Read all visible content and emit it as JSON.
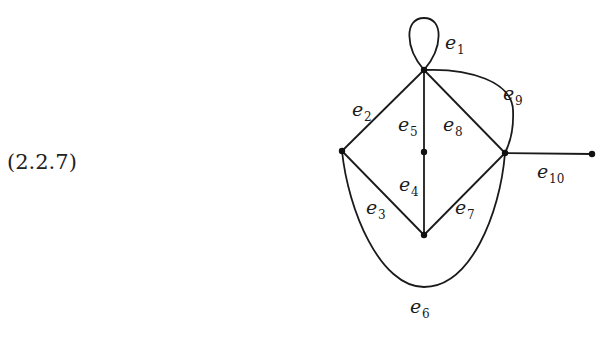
{
  "equation_label": "(2.2.7)",
  "graph": {
    "vertices": [
      {
        "id": "top",
        "x": 424,
        "y": 70
      },
      {
        "id": "left",
        "x": 342,
        "y": 151
      },
      {
        "id": "middle",
        "x": 424,
        "y": 152
      },
      {
        "id": "right",
        "x": 505,
        "y": 153
      },
      {
        "id": "bottom",
        "x": 424,
        "y": 235
      },
      {
        "id": "far-right",
        "x": 592,
        "y": 154
      }
    ],
    "edges": [
      {
        "id": "e1",
        "base": "e",
        "sub": "1",
        "from": "top",
        "to": "top",
        "kind": "loop"
      },
      {
        "id": "e2",
        "base": "e",
        "sub": "2",
        "from": "top",
        "to": "left"
      },
      {
        "id": "e3",
        "base": "e",
        "sub": "3",
        "from": "left",
        "to": "bottom"
      },
      {
        "id": "e4",
        "base": "e",
        "sub": "4",
        "from": "middle",
        "to": "bottom"
      },
      {
        "id": "e5",
        "base": "e",
        "sub": "5",
        "from": "top",
        "to": "middle"
      },
      {
        "id": "e6",
        "base": "e",
        "sub": "6",
        "from": "left",
        "to": "right",
        "kind": "curve-below"
      },
      {
        "id": "e7",
        "base": "e",
        "sub": "7",
        "from": "bottom",
        "to": "right"
      },
      {
        "id": "e8",
        "base": "e",
        "sub": "8",
        "from": "top",
        "to": "right"
      },
      {
        "id": "e9",
        "base": "e",
        "sub": "9",
        "from": "top",
        "to": "right",
        "kind": "curve-outer"
      },
      {
        "id": "e10",
        "base": "e",
        "sub": "10",
        "from": "right",
        "to": "far-right"
      }
    ]
  },
  "labels": {
    "e1": {
      "base": "e",
      "sub": "1"
    },
    "e2": {
      "base": "e",
      "sub": "2"
    },
    "e3": {
      "base": "e",
      "sub": "3"
    },
    "e4": {
      "base": "e",
      "sub": "4"
    },
    "e5": {
      "base": "e",
      "sub": "5"
    },
    "e6": {
      "base": "e",
      "sub": "6"
    },
    "e7": {
      "base": "e",
      "sub": "7"
    },
    "e8": {
      "base": "e",
      "sub": "8"
    },
    "e9": {
      "base": "e",
      "sub": "9"
    },
    "e10": {
      "base": "e",
      "sub": "10"
    }
  }
}
